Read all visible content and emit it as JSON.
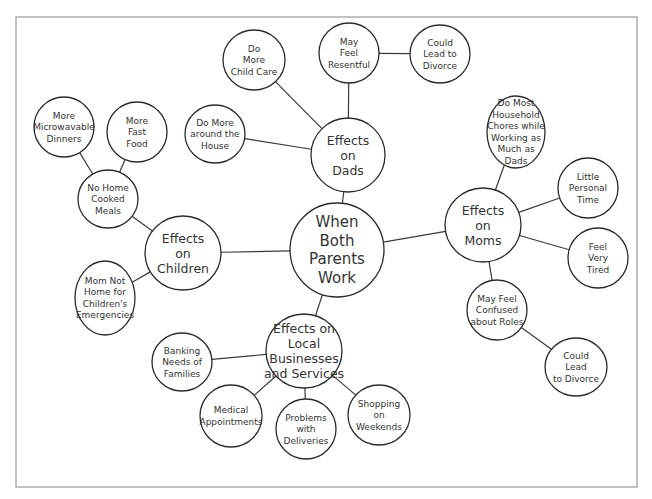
{
  "diagram": {
    "type": "bubble-map",
    "frame": {
      "x": 16,
      "y": 17,
      "w": 621,
      "h": 470
    },
    "central": {
      "id": "center",
      "lines": [
        "When",
        "Both",
        "Parents",
        "Work"
      ],
      "cx": 337,
      "cy": 250,
      "rx": 47,
      "ry": 47,
      "size": "big"
    },
    "nodes": [
      {
        "id": "dads",
        "lines": [
          "Effects",
          "on",
          "Dads"
        ],
        "cx": 348,
        "cy": 155,
        "rx": 37,
        "ry": 37,
        "size": "mid"
      },
      {
        "id": "dads-childcare",
        "lines": [
          "Do",
          "More",
          "Child Care"
        ],
        "cx": 254,
        "cy": 60,
        "rx": 31,
        "ry": 30,
        "size": "small"
      },
      {
        "id": "dads-resentful",
        "lines": [
          "May",
          "Feel",
          "Resentful"
        ],
        "cx": 349,
        "cy": 53,
        "rx": 30,
        "ry": 30,
        "size": "small"
      },
      {
        "id": "dads-divorce",
        "lines": [
          "Could",
          "Lead to",
          "Divorce"
        ],
        "cx": 440,
        "cy": 54,
        "rx": 30,
        "ry": 29,
        "size": "small"
      },
      {
        "id": "dads-house",
        "lines": [
          "Do More",
          "around the",
          "House"
        ],
        "cx": 215,
        "cy": 134,
        "rx": 30,
        "ry": 29,
        "size": "small"
      },
      {
        "id": "children",
        "lines": [
          "Effects",
          "on",
          "Children"
        ],
        "cx": 183,
        "cy": 253,
        "rx": 38,
        "ry": 37,
        "size": "mid"
      },
      {
        "id": "children-meals",
        "lines": [
          "No Home",
          "Cooked",
          "Meals"
        ],
        "cx": 108,
        "cy": 199,
        "rx": 30,
        "ry": 29,
        "size": "small"
      },
      {
        "id": "children-microwave",
        "lines": [
          "More",
          "Microwavable",
          "Dinners"
        ],
        "cx": 64,
        "cy": 127,
        "rx": 30,
        "ry": 30,
        "size": "small"
      },
      {
        "id": "children-fastfood",
        "lines": [
          "More",
          "Fast",
          "Food"
        ],
        "cx": 137,
        "cy": 132,
        "rx": 30,
        "ry": 30,
        "size": "small"
      },
      {
        "id": "children-emergencies",
        "lines": [
          "Mom Not",
          "Home for",
          "Children's",
          "Emergencies"
        ],
        "cx": 105,
        "cy": 298,
        "rx": 30,
        "ry": 37,
        "size": "small"
      },
      {
        "id": "moms",
        "lines": [
          "Effects",
          "on",
          "Moms"
        ],
        "cx": 483,
        "cy": 225,
        "rx": 38,
        "ry": 37,
        "size": "mid"
      },
      {
        "id": "moms-chores",
        "lines": [
          "Do Most",
          "Household",
          "Chores while",
          "Working as",
          "Much as",
          "Dads"
        ],
        "cx": 516,
        "cy": 132,
        "rx": 29,
        "ry": 36,
        "size": "small"
      },
      {
        "id": "moms-personal",
        "lines": [
          "Little",
          "Personal",
          "Time"
        ],
        "cx": 588,
        "cy": 188,
        "rx": 30,
        "ry": 30,
        "size": "small"
      },
      {
        "id": "moms-tired",
        "lines": [
          "Feel",
          "Very",
          "Tired"
        ],
        "cx": 598,
        "cy": 258,
        "rx": 30,
        "ry": 30,
        "size": "small"
      },
      {
        "id": "moms-confused",
        "lines": [
          "May Feel",
          "Confused",
          "about Roles"
        ],
        "cx": 497,
        "cy": 310,
        "rx": 30,
        "ry": 30,
        "size": "small"
      },
      {
        "id": "moms-divorce",
        "lines": [
          "Could",
          "Lead",
          "to Divorce"
        ],
        "cx": 576,
        "cy": 367,
        "rx": 31,
        "ry": 29,
        "size": "small"
      },
      {
        "id": "business",
        "lines": [
          "Effects on",
          "Local",
          "Businesses",
          "and Services"
        ],
        "cx": 304,
        "cy": 351,
        "rx": 38,
        "ry": 37,
        "size": "mid"
      },
      {
        "id": "business-banking",
        "lines": [
          "Banking",
          "Needs of",
          "Families"
        ],
        "cx": 182,
        "cy": 362,
        "rx": 30,
        "ry": 29,
        "size": "small"
      },
      {
        "id": "business-medical",
        "lines": [
          "Medical",
          "Appointments"
        ],
        "cx": 231,
        "cy": 416,
        "rx": 31,
        "ry": 31,
        "size": "small"
      },
      {
        "id": "business-deliveries",
        "lines": [
          "Problems",
          "with",
          "Deliveries"
        ],
        "cx": 306,
        "cy": 429,
        "rx": 30,
        "ry": 30,
        "size": "small"
      },
      {
        "id": "business-shopping",
        "lines": [
          "Shopping",
          "on",
          "Weekends"
        ],
        "cx": 379,
        "cy": 415,
        "rx": 31,
        "ry": 30,
        "size": "small"
      }
    ],
    "edges": [
      [
        "center",
        "dads"
      ],
      [
        "center",
        "children"
      ],
      [
        "center",
        "moms"
      ],
      [
        "center",
        "business"
      ],
      [
        "dads",
        "dads-childcare"
      ],
      [
        "dads",
        "dads-resentful"
      ],
      [
        "dads",
        "dads-house"
      ],
      [
        "dads-resentful",
        "dads-divorce"
      ],
      [
        "children",
        "children-meals"
      ],
      [
        "children",
        "children-emergencies"
      ],
      [
        "children-meals",
        "children-microwave"
      ],
      [
        "children-meals",
        "children-fastfood"
      ],
      [
        "moms",
        "moms-chores"
      ],
      [
        "moms",
        "moms-personal"
      ],
      [
        "moms",
        "moms-tired"
      ],
      [
        "moms",
        "moms-confused"
      ],
      [
        "moms-confused",
        "moms-divorce"
      ],
      [
        "business",
        "business-banking"
      ],
      [
        "business",
        "business-medical"
      ],
      [
        "business",
        "business-deliveries"
      ],
      [
        "business",
        "business-shopping"
      ]
    ]
  }
}
